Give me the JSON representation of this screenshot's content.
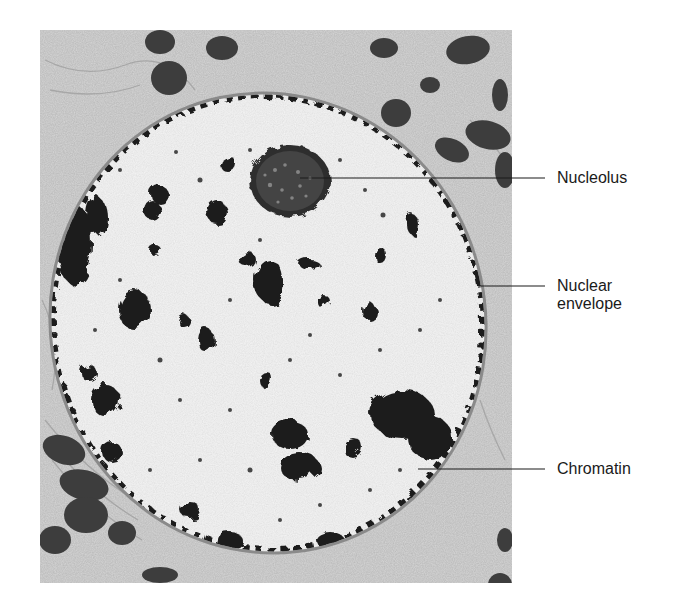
{
  "figure": {
    "type": "electron micrograph",
    "labels": [
      {
        "id": "nucleolus",
        "text": "Nucleolus",
        "line1": "Nucleolus",
        "line2": "",
        "pointer_from": [
          300,
          178
        ],
        "pointer_to": [
          545,
          178
        ],
        "text_pos": [
          557,
          169
        ]
      },
      {
        "id": "nuclear-envelope",
        "text": "Nuclear envelope",
        "line1": "Nuclear",
        "line2": "envelope",
        "pointer_from": [
          479,
          286
        ],
        "pointer_to": [
          545,
          286
        ],
        "text_pos": [
          557,
          277
        ]
      },
      {
        "id": "chromatin",
        "text": "Chromatin",
        "line1": "Chromatin",
        "line2": "",
        "pointer_from": [
          418,
          469
        ],
        "pointer_to": [
          545,
          469
        ],
        "text_pos": [
          557,
          460
        ]
      }
    ]
  },
  "colors": {
    "background": "#ffffff",
    "cytoplasm": "#d9d9d9",
    "nucleoplasm": "#f7f7f7",
    "heterochromatin": "#1c1c1c",
    "nucleolus": "#3a3a3a",
    "label_text": "#1a1a1a"
  }
}
